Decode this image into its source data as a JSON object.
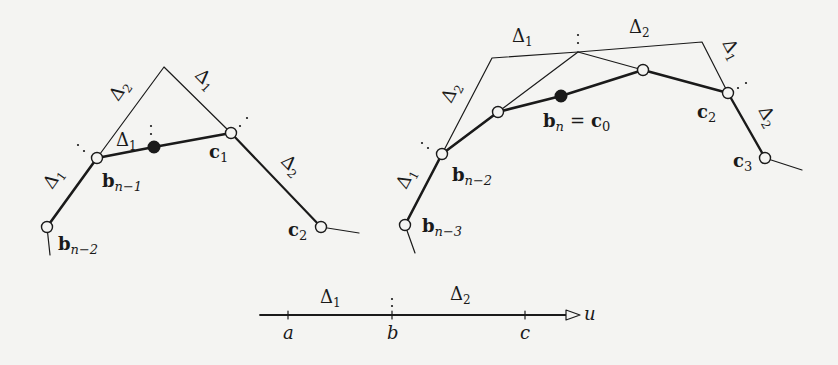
{
  "figure": {
    "colors": {
      "ink": "#1a1a1a",
      "background": "#f4f4f2"
    },
    "left_diagram": {
      "points": {
        "b_n_minus_2": [
          47,
          227
        ],
        "b_n_minus_1": [
          97,
          158
        ],
        "apex": [
          164,
          67
        ],
        "black_dot": [
          154,
          147
        ],
        "c1": [
          231,
          133
        ],
        "c2": [
          321,
          227
        ]
      },
      "labels": {
        "b_n_minus_2": "b",
        "b_n_minus_2_sub": "n−2",
        "b_n_minus_1": "b",
        "b_n_minus_1_sub": "n−1",
        "c1": "c",
        "c1_sub": "1",
        "c2": "c",
        "c2_sub": "2",
        "delta1_lower": "Δ",
        "delta1_lower_sub": "1",
        "delta2_upper": "Δ",
        "delta2_upper_sub": "2",
        "delta1_upper": "Δ",
        "delta1_upper_sub": "1",
        "delta1_inner": "Δ",
        "delta1_inner_sub": "1",
        "delta2_lower": "Δ",
        "delta2_lower_sub": "2"
      }
    },
    "right_diagram": {
      "points": {
        "b_n_minus_3": [
          405,
          225
        ],
        "b_n_minus_2": [
          442,
          154
        ],
        "top_left": [
          492,
          58
        ],
        "top_mid": [
          578,
          52
        ],
        "top_right": [
          702,
          42
        ],
        "node_a": [
          498,
          112
        ],
        "black_dot": [
          561,
          96
        ],
        "node_b": [
          643,
          70
        ],
        "c2": [
          728,
          93
        ],
        "c3": [
          765,
          158
        ]
      },
      "labels": {
        "b_n_minus_3": "b",
        "b_n_minus_3_sub": "n−3",
        "b_n_minus_2": "b",
        "b_n_minus_2_sub": "n−2",
        "bn_eq_c0": "b",
        "bn_sub": "n",
        "eq": "=",
        "c0": "c",
        "c0_sub": "0",
        "c2": "c",
        "c2_sub": "2",
        "c3": "c",
        "c3_sub": "3",
        "delta1_top": "Δ",
        "delta1_top_sub": "1",
        "delta2_top": "Δ",
        "delta2_top_sub": "2",
        "delta2_left": "Δ",
        "delta2_left_sub": "2",
        "delta1_left": "Δ",
        "delta1_left_sub": "1",
        "delta1_right": "Δ",
        "delta1_right_sub": "1",
        "delta2_right": "Δ",
        "delta2_right_sub": "2"
      }
    },
    "axis": {
      "y": 315,
      "x_start": 260,
      "x_end": 578,
      "ticks": [
        {
          "x": 288,
          "label": "a"
        },
        {
          "x": 392,
          "label": "b"
        },
        {
          "x": 525,
          "label": "c"
        }
      ],
      "variable": "u",
      "interval_labels": [
        {
          "text": "Δ",
          "sub": "1"
        },
        {
          "text": "Δ",
          "sub": "2"
        }
      ]
    }
  }
}
